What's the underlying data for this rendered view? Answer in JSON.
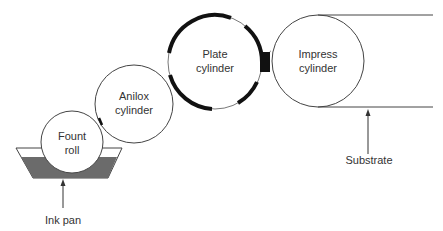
{
  "diagram": {
    "type": "flexographic printing unit schematic",
    "colors": {
      "line": "#444444",
      "plate": "#111111",
      "ink": "#6b6b6b",
      "background": "#ffffff"
    },
    "components": [
      {
        "id": "fount-roll",
        "label_line1": "Fount",
        "label_line2": "roll"
      },
      {
        "id": "anilox-cylinder",
        "label_line1": "Anilox",
        "label_line2": "cylinder"
      },
      {
        "id": "plate-cylinder",
        "label_line1": "Plate",
        "label_line2": "cylinder"
      },
      {
        "id": "impress-cylinder",
        "label_line1": "Impress",
        "label_line2": "cylinder"
      }
    ],
    "callouts": {
      "ink_pan": "Ink pan",
      "substrate": "Substrate"
    }
  }
}
